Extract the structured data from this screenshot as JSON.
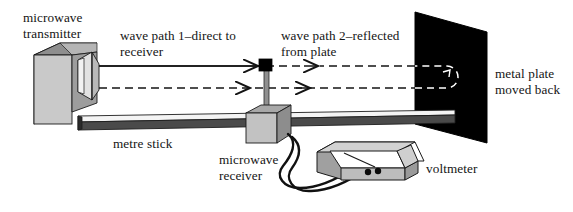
{
  "diagram": {
    "labels": {
      "transmitter": "microwave\ntransmitter",
      "wave_path_1": "wave path 1–direct to\nreceiver",
      "wave_path_2": "wave path 2–reflected\nfrom plate",
      "metal_plate": "metal plate\nmoved back",
      "metre_stick": "metre stick",
      "receiver": "microwave\nreceiver",
      "voltmeter": "voltmeter"
    },
    "colors": {
      "ink": "#141414",
      "plate_fill": "#000000",
      "box_front": "#c9c9c9",
      "box_top": "#a8a8a8",
      "box_side": "#3b3b3b",
      "stick_top": "#f4f4f4",
      "stick_front": "#4a4a4a",
      "horn_fill": "#e8e8e8",
      "dash_on_plate": "#ffffff"
    },
    "icon_names": [
      "microwave-transmitter-icon",
      "microwave-receiver-icon",
      "metal-plate-icon",
      "metre-stick-icon",
      "voltmeter-icon",
      "wave-path-direct-arrow-icon",
      "wave-path-reflected-arrow-icon"
    ]
  }
}
